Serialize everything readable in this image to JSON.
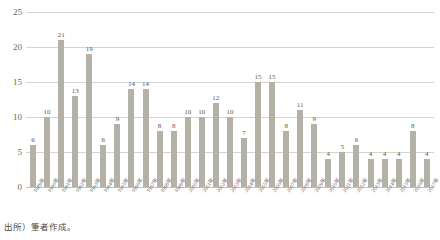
{
  "chart_data": {
    "type": "bar",
    "title": "",
    "subtitle": "",
    "xlabel": "",
    "ylabel": "",
    "ylim": [
      0,
      25
    ],
    "yticks": [
      0,
      5,
      10,
      15,
      20,
      25
    ],
    "grid": true,
    "legend": null,
    "orientation": "vertical",
    "bar_color": "#b4b1a6",
    "gridline_color": "#d6d4cf",
    "categories": [
      "1989年",
      "1990年",
      "1991年",
      "1992年",
      "1993年",
      "1994年",
      "1995年",
      "1996年",
      "1997年",
      "1998年",
      "1999年",
      "2000年",
      "2001年",
      "2002年",
      "2003年",
      "2004年",
      "2005年",
      "2006年",
      "2007年",
      "2008年",
      "2009年",
      "2010年",
      "2011年",
      "2012年",
      "2013年",
      "2014年",
      "2015年",
      "2016年",
      "2017年"
    ],
    "values": [
      6,
      10,
      21,
      13,
      19,
      6,
      9,
      14,
      14,
      8,
      8,
      10,
      10,
      12,
      10,
      7,
      15,
      15,
      8,
      11,
      9,
      4,
      5,
      6,
      4,
      4,
      4,
      8,
      4
    ],
    "data_labels": [
      "6",
      "10",
      "21",
      "13",
      "19",
      "6",
      "9",
      "14",
      "14",
      "8",
      "8",
      "10",
      "10",
      "12",
      "10",
      "7",
      "15",
      "15",
      "8",
      "11",
      "9",
      "4",
      "5",
      "6",
      "4",
      "4",
      "4",
      "8",
      "4"
    ],
    "annotations": []
  },
  "footnote": {
    "source": "出所）筆者作成。"
  }
}
